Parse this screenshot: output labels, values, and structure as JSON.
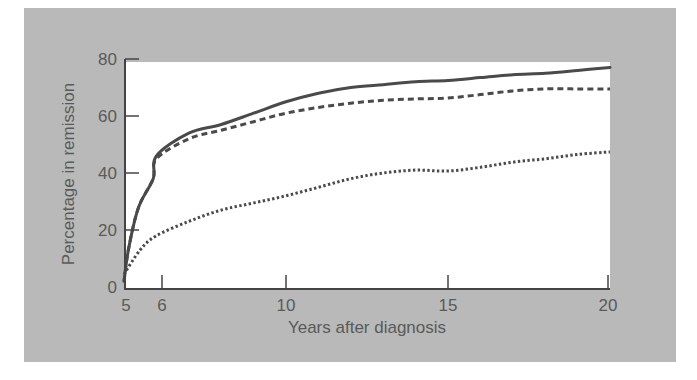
{
  "chart_data": {
    "type": "line",
    "title": "",
    "xlabel": "Years after diagnosis",
    "ylabel": "Percentage in remission",
    "xlim": [
      5,
      20
    ],
    "ylim": [
      0,
      80
    ],
    "x_ticks": [
      5,
      6,
      10,
      15,
      20
    ],
    "y_ticks": [
      0,
      20,
      40,
      60,
      80
    ],
    "grid": false,
    "legend": null,
    "series": [
      {
        "name": "solid",
        "style": "solid",
        "x": [
          5,
          5.15,
          5.45,
          5.9,
          6,
          7,
          8,
          9,
          10,
          11,
          12,
          13,
          14,
          15,
          16,
          17,
          18,
          19,
          20
        ],
        "y": [
          2,
          14,
          28,
          38,
          46,
          54,
          57,
          61,
          65,
          68,
          70,
          71,
          72,
          72.5,
          73.5,
          74.5,
          75,
          76,
          77
        ]
      },
      {
        "name": "dashed",
        "style": "dashed",
        "x": [
          5,
          5.15,
          5.45,
          5.9,
          6,
          7,
          8,
          9,
          10,
          11,
          12,
          13,
          14,
          15,
          16,
          17,
          18,
          19,
          20
        ],
        "y": [
          2,
          14,
          28,
          38,
          45,
          52,
          55,
          58,
          61,
          63,
          64.5,
          65.5,
          66,
          66.3,
          67.5,
          68.8,
          69.5,
          69.5,
          69.5
        ]
      },
      {
        "name": "dotted",
        "style": "dotted",
        "x": [
          5,
          5.5,
          6,
          7,
          8,
          9,
          10,
          11,
          12,
          13,
          14,
          15,
          16,
          17,
          18,
          19,
          20
        ],
        "y": [
          4.5,
          13,
          18,
          23,
          27,
          29.5,
          32,
          35,
          38,
          40,
          41,
          40.7,
          42,
          43.8,
          45,
          46.5,
          47.4
        ]
      }
    ]
  },
  "axes": {
    "xlabel": "Years after diagnosis",
    "ylabel": "Percentage in remission",
    "x_tick_labels": [
      "5",
      "6",
      "10",
      "15",
      "20"
    ],
    "y_tick_labels": [
      "0",
      "20",
      "40",
      "60",
      "80"
    ]
  }
}
